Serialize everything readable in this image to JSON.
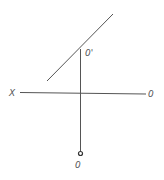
{
  "diagram": {
    "type": "descriptive-geometry-projection",
    "labels": {
      "axis_left": "X",
      "axis_right": "0",
      "point_upper": "0'",
      "point_lower": "0"
    },
    "colors": {
      "line": "#555555",
      "background": "#ffffff"
    }
  }
}
